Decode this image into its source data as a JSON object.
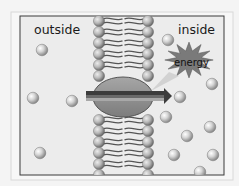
{
  "diagram": {
    "labels": {
      "outside": "outside",
      "inside": "inside",
      "energy": "energy"
    },
    "colors": {
      "page_bg": "#f4f4f4",
      "frame_outer": "#d8d8d8",
      "panel_bg": "#ececec",
      "panel_border": "#3a3a3a",
      "molecule_light": "#e6e6e6",
      "molecule_dark": "#8a8a8a",
      "head_light": "#d0d0d0",
      "head_dark": "#6e6e6e",
      "tail": "#555555",
      "protein": "#8f8f8f",
      "protein_stroke": "#555555",
      "arrow_dark": "#3c3c3c",
      "arrow_mid": "#6a6a6a",
      "arrow_light": "#a8a8a8",
      "star": "#7a7a7a"
    },
    "frame": {
      "outer": [
        11,
        12,
        222,
        168
      ],
      "panel": [
        20,
        16,
        204,
        159
      ]
    },
    "membrane": {
      "left_x": 99,
      "right_x": 148,
      "head_r": 5.6,
      "top_y": 21,
      "bottom_y": 172,
      "spacing": 11
    },
    "protein": {
      "cx": 123,
      "cy": 97,
      "rx": 30,
      "ry": 20
    },
    "arrow": {
      "x1": 86,
      "x2": 172,
      "y": 96
    },
    "energy_star": {
      "cx": 189,
      "cy": 60,
      "r_outer": 23,
      "r_inner": 12,
      "points": 12
    },
    "molecules_outside": [
      {
        "cx": 42,
        "cy": 50
      },
      {
        "cx": 33,
        "cy": 98
      },
      {
        "cx": 72,
        "cy": 101
      },
      {
        "cx": 40,
        "cy": 153
      }
    ],
    "molecules_inside": [
      {
        "cx": 168,
        "cy": 40
      },
      {
        "cx": 212,
        "cy": 84
      },
      {
        "cx": 180,
        "cy": 97
      },
      {
        "cx": 166,
        "cy": 117
      },
      {
        "cx": 210,
        "cy": 127
      },
      {
        "cx": 187,
        "cy": 136
      },
      {
        "cx": 174,
        "cy": 155
      },
      {
        "cx": 213,
        "cy": 155
      },
      {
        "cx": 200,
        "cy": 172
      }
    ],
    "molecule_r": 5.8
  }
}
